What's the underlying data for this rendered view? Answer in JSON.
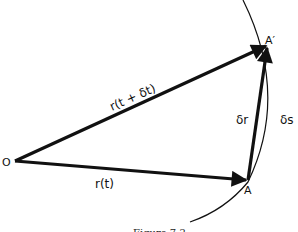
{
  "figure": {
    "caption": "Figure 7.2",
    "points": {
      "origin": {
        "label": "O",
        "x": 15,
        "y": 161
      },
      "a": {
        "label": "A",
        "x": 248,
        "y": 180
      },
      "a_prime": {
        "label": "A′",
        "x": 268,
        "y": 45
      }
    },
    "vectors": {
      "r_t": {
        "label": "r(t)"
      },
      "r_t_dt": {
        "label": "r(t + δt)"
      },
      "delta_r": {
        "label": "δr"
      }
    },
    "arc": {
      "label": "δs"
    },
    "colors": {
      "ink": "#111111",
      "background": "#ffffff"
    }
  }
}
